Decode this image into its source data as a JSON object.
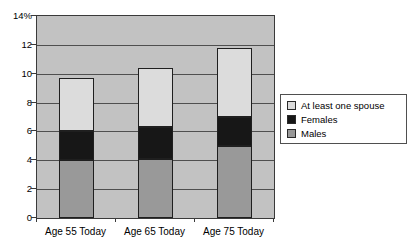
{
  "chart_data": {
    "type": "bar",
    "variant": "stacked-column",
    "title": "",
    "xlabel": "",
    "ylabel": "",
    "categories": [
      "Age 55 Today",
      "Age 65 Today",
      "Age 75 Today"
    ],
    "series": [
      {
        "name": "Males",
        "color": "#999999",
        "values": [
          4.0,
          4.1,
          5.0
        ]
      },
      {
        "name": "Females",
        "color": "#171717",
        "values": [
          2.0,
          2.2,
          2.0
        ]
      },
      {
        "name": "At least one spouse",
        "color": "#dcdcdc",
        "values": [
          3.7,
          4.1,
          4.8
        ]
      }
    ],
    "stack_totals": [
      9.7,
      10.4,
      11.8
    ],
    "ylim": [
      0,
      14
    ],
    "ytick_step": 2,
    "ytick_labels": [
      "0",
      "2",
      "4",
      "6",
      "8",
      "10",
      "12",
      "14%"
    ],
    "grid": true,
    "plot_background": "#c2c2c2",
    "legend_position": "right",
    "legend_order": [
      "At least one spouse",
      "Females",
      "Males"
    ]
  }
}
